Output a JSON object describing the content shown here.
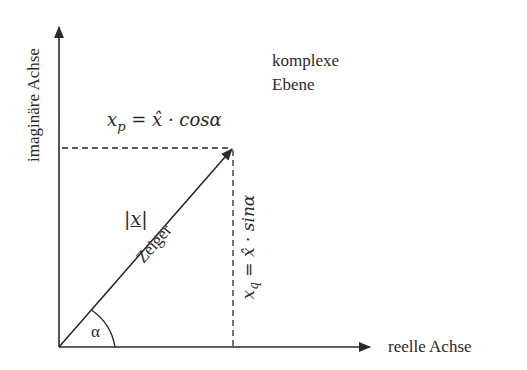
{
  "diagram": {
    "title_line1": "komplexe",
    "title_line2": "Ebene",
    "y_axis_label": "imaginäre Achse",
    "x_axis_label": "reelle Achse",
    "vector_label": "Zeiger",
    "magnitude_label": "|x|",
    "magnitude_symbol": "x",
    "angle_label": "α",
    "projection_x_label": "x_p = x̂ · cosα",
    "projection_x_parts": {
      "var": "x",
      "sub": "p",
      "rhs": " = x̂ · cosα"
    },
    "projection_y_label": "x_q = x̂ · sinα",
    "projection_y_parts": {
      "var": "x",
      "sub": "q",
      "rhs": " = x̂ · sinα"
    },
    "colors": {
      "line": "#2a2a2a",
      "background": "#ffffff"
    }
  }
}
